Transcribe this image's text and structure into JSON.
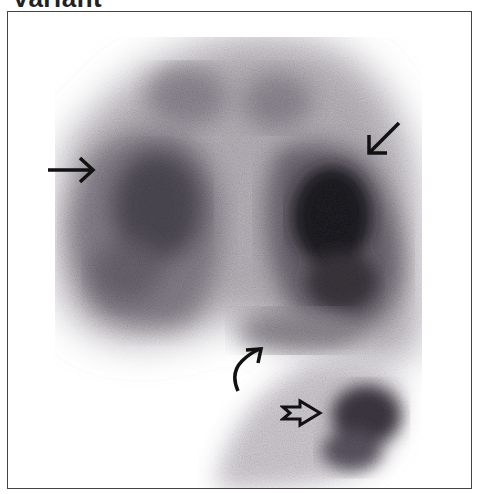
{
  "figure": {
    "title": "Variant",
    "colors": {
      "tracer_dark": "#1a1418",
      "tracer_mid": "#6e6670",
      "tracer_light": "#c4c0c6",
      "background": "#ffffff",
      "frame": "#444444"
    },
    "annotations": [
      {
        "type": "arrow",
        "direction": "right",
        "label": "left-arrow"
      },
      {
        "type": "arrow",
        "direction": "down-left",
        "label": "upper-right-arrow"
      },
      {
        "type": "curved-arrow",
        "direction": "up-right",
        "label": "curved-arrow"
      },
      {
        "type": "open-arrow",
        "direction": "right",
        "label": "open-arrow"
      }
    ]
  }
}
